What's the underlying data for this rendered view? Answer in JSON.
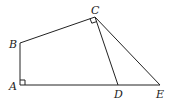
{
  "diagram": {
    "points": {
      "A": {
        "label": "A",
        "x": 20,
        "y": 85
      },
      "B": {
        "label": "B",
        "x": 20,
        "y": 43
      },
      "C": {
        "label": "C",
        "x": 95,
        "y": 17
      },
      "D": {
        "label": "D",
        "x": 118,
        "y": 85
      },
      "E": {
        "label": "E",
        "x": 160,
        "y": 85
      }
    },
    "segments": [
      "AB",
      "BC",
      "CD",
      "CE",
      "AE"
    ],
    "right_angles": [
      "A",
      "C"
    ],
    "stroke_color": "#222222"
  }
}
